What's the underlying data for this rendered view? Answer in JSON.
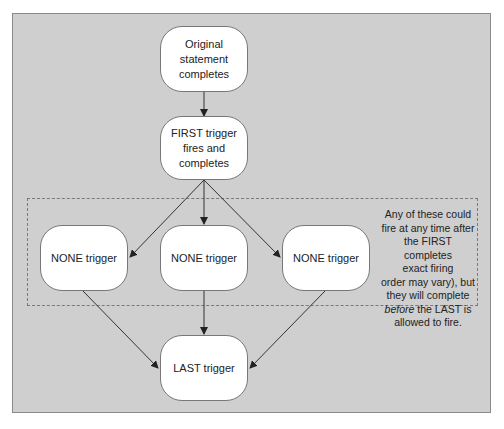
{
  "diagram": {
    "nodes": [
      {
        "id": "original",
        "label": "Original statement\ncompletes"
      },
      {
        "id": "first",
        "label": "FIRST trigger\nfires and\ncompletes"
      },
      {
        "id": "none1",
        "label": "NONE trigger"
      },
      {
        "id": "none2",
        "label": "NONE trigger"
      },
      {
        "id": "none3",
        "label": "NONE trigger"
      },
      {
        "id": "last",
        "label": "LAST trigger"
      }
    ],
    "edges": [
      {
        "from": "original",
        "to": "first"
      },
      {
        "from": "first",
        "to": "none1"
      },
      {
        "from": "first",
        "to": "none2"
      },
      {
        "from": "first",
        "to": "none3"
      },
      {
        "from": "none1",
        "to": "last"
      },
      {
        "from": "none2",
        "to": "last"
      },
      {
        "from": "none3",
        "to": "last"
      }
    ],
    "note": {
      "line1": "Any of these could",
      "line2": "fire at any time after",
      "line3": "the FIRST completes",
      "line4": "exact firing",
      "line5": "order may vary), but",
      "line6": "they will complete",
      "line7_em": "before",
      "line7_rest": " the LAST is",
      "line8": "allowed to fire."
    },
    "colors": {
      "background": "#cfcfcf",
      "node_fill": "#ffffff",
      "stroke": "#444444"
    }
  }
}
